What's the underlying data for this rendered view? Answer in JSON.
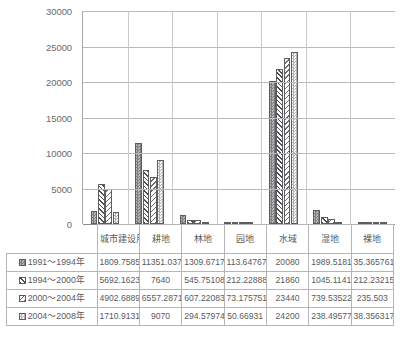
{
  "chart_data": {
    "type": "bar",
    "title": "",
    "subtitle": "",
    "xlabel": "",
    "ylabel": "",
    "ylim": [
      0,
      30000
    ],
    "y_ticks": [
      0,
      5000,
      10000,
      15000,
      20000,
      25000,
      30000
    ],
    "y_tick_labels": [
      "0",
      "5000",
      "10000",
      "15000",
      "20000",
      "25000",
      "30000"
    ],
    "grid": true,
    "legend_position": "table-below",
    "categories": [
      "城市建设用地",
      "耕地",
      "林地",
      "园地",
      "水域",
      "湿地",
      "裸地"
    ],
    "series": [
      {
        "name": "1991～1994年",
        "pattern": "dark-checker",
        "values": [
          1809.7585,
          11351.037,
          1309.6717,
          113.64767,
          20080,
          1989.5181,
          35.365761
        ],
        "labels": [
          "1809.7585",
          "11351.037",
          "1309.6717",
          "113.64767",
          "20080",
          "1989.5181",
          "35.365761"
        ]
      },
      {
        "name": "1994～2000年",
        "pattern": "dense-diagonal",
        "values": [
          5692.1623,
          7640,
          545.75108,
          212.22888,
          21860,
          1045.1141,
          212.23215
        ],
        "labels": [
          "5692.1623",
          "7640",
          "545.75108",
          "212.22888",
          "21860",
          "1045.1141",
          "212.23215"
        ]
      },
      {
        "name": "2000～2004年",
        "pattern": "light-diagonal",
        "values": [
          4902.6889,
          6557.2871,
          607.22083,
          73.175751,
          23440,
          739.53522,
          235.503
        ],
        "labels": [
          "4902.6889",
          "6557.2871",
          "607.22083",
          "73.175751",
          "23440",
          "739.53522",
          "235.503"
        ]
      },
      {
        "name": "2004～2008年",
        "pattern": "light-checker",
        "values": [
          1710.9131,
          9070,
          294.57974,
          50.66931,
          24200,
          238.49577,
          38.356317
        ],
        "labels": [
          "1710.9131",
          "9070",
          "294.57974",
          "50.66931",
          "24200",
          "238.49577",
          "38.356317"
        ]
      }
    ]
  },
  "colors": {
    "grid": "#b9b9bb",
    "axis": "#8c8c8e",
    "text": "#58585a",
    "table_border": "#b6b6b8",
    "bar_outline": "#5d5d5f"
  }
}
